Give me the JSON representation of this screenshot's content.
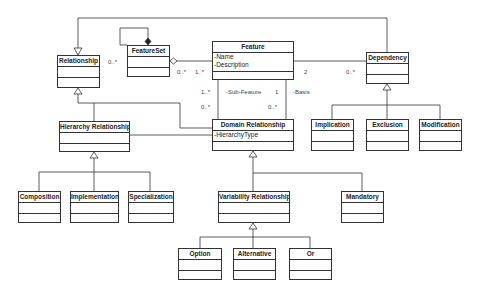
{
  "classes": {
    "relationship": {
      "name": "Relationship",
      "attrs": []
    },
    "featureset": {
      "name": "FeatureSet",
      "attrs": []
    },
    "feature": {
      "name": "Feature",
      "attrs": [
        "-Name",
        "-Description"
      ]
    },
    "dependency": {
      "name": "Dependency",
      "attrs": []
    },
    "hierarchy": {
      "name": "Hierarchy Relationship",
      "attrs": []
    },
    "domain": {
      "name": "Domain Relationship",
      "attrs": [
        "-HierarchyType"
      ]
    },
    "implication": {
      "name": "Implication",
      "attrs": []
    },
    "exclusion": {
      "name": "Exclusion",
      "attrs": []
    },
    "modification": {
      "name": "Modification",
      "attrs": []
    },
    "composition": {
      "name": "Composition",
      "attrs": []
    },
    "implementation": {
      "name": "Implementation",
      "attrs": []
    },
    "specialization": {
      "name": "Specialization",
      "attrs": []
    },
    "variability": {
      "name": "Variability Relationship",
      "attrs": []
    },
    "mandatory": {
      "name": "Mandatory",
      "attrs": []
    },
    "option": {
      "name": "Option",
      "attrs": []
    },
    "alternative": {
      "name": "Alternative",
      "attrs": []
    },
    "or": {
      "name": "Or",
      "attrs": []
    }
  },
  "labels": {
    "rel_fs_mult": "0..*",
    "fs_agg_mult": "0..*",
    "feature_fs_mult": "1..*",
    "feature_dep_mult": "2",
    "dep_feature_mult": "0..*",
    "sub_top_mult": "1..*",
    "sub_role": "-Sub-Feature",
    "basis_top_mult": "1",
    "basis_role": "-Basis",
    "sub_bottom_mult": "0..*",
    "basis_bottom_mult": "0..*"
  },
  "colors": {
    "line": "#333333",
    "background": "#ffffff"
  }
}
